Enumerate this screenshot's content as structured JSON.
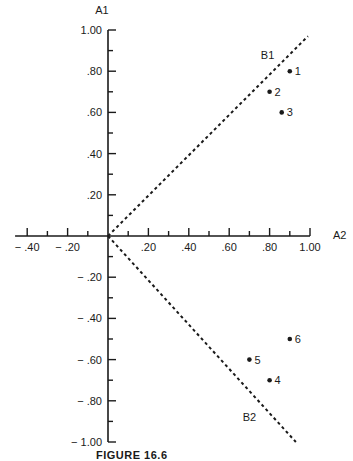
{
  "chart_data": {
    "type": "scatter",
    "title": "",
    "xlabel": "A2",
    "ylabel": "A1",
    "xlim": [
      -0.4,
      1.0
    ],
    "ylim": [
      -1.0,
      1.0
    ],
    "grid": false,
    "x_ticks": [
      "-.40",
      "-.20",
      ".20",
      ".40",
      ".60",
      ".80",
      "1.00"
    ],
    "x_tick_values": [
      -0.4,
      -0.2,
      0.2,
      0.4,
      0.6,
      0.8,
      1.0
    ],
    "y_ticks": [
      "1.00",
      ".80",
      ".60",
      ".40",
      ".20",
      "-.20",
      "-.40",
      "-.60",
      "-.80",
      "-1.00"
    ],
    "y_tick_values": [
      1.0,
      0.8,
      0.6,
      0.4,
      0.2,
      -0.2,
      -0.4,
      -0.6,
      -0.8,
      -1.0
    ],
    "points": [
      {
        "label": "1",
        "x": 0.9,
        "y": 0.8
      },
      {
        "label": "2",
        "x": 0.8,
        "y": 0.7
      },
      {
        "label": "3",
        "x": 0.86,
        "y": 0.6
      },
      {
        "label": "4",
        "x": 0.8,
        "y": -0.7
      },
      {
        "label": "5",
        "x": 0.7,
        "y": -0.6
      },
      {
        "label": "6",
        "x": 0.9,
        "y": -0.5
      }
    ],
    "vectors": [
      {
        "label": "B1",
        "style": "dashed",
        "from": [
          0,
          0
        ],
        "to": [
          0.99,
          0.97
        ]
      },
      {
        "label": "B2",
        "style": "dashed",
        "from": [
          0,
          0
        ],
        "to": [
          0.93,
          -1.0
        ]
      }
    ],
    "annotations": [
      "A1",
      "A2",
      "B1",
      "B2"
    ]
  },
  "caption": "FIGURE 16.6"
}
